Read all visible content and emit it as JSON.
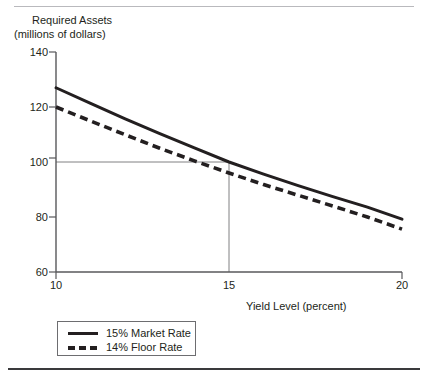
{
  "chart_data": {
    "type": "line",
    "title": "Required Assets",
    "subtitle": "(millions of dollars)",
    "ylabel": "Required Assets (millions of dollars)",
    "xlabel": "Yield Level (percent)",
    "xlim": [
      10,
      20
    ],
    "ylim": [
      60,
      140
    ],
    "xticks": [
      "10",
      "15",
      "20"
    ],
    "yticks": [
      "140",
      "120",
      "100",
      "80",
      "60"
    ],
    "grid": false,
    "legend_position": "below-left",
    "series": [
      {
        "name": "15% Market Rate",
        "style": "solid",
        "color": "#231f20",
        "x": [
          10,
          11,
          12,
          13,
          14,
          15,
          16,
          17,
          18,
          19,
          20
        ],
        "values": [
          127.0,
          121.3,
          115.7,
          110.3,
          105.1,
          100.0,
          95.6,
          91.4,
          87.4,
          83.6,
          79.2
        ]
      },
      {
        "name": "14% Floor Rate",
        "style": "dashed",
        "color": "#231f20",
        "x": [
          10,
          11,
          12,
          13,
          14,
          15,
          16,
          17,
          18,
          19,
          20
        ],
        "values": [
          120.0,
          114.9,
          109.9,
          105.0,
          100.4,
          96.0,
          91.8,
          87.9,
          84.0,
          80.0,
          75.6
        ]
      }
    ],
    "annotations": [
      {
        "name": "reference-horizontal",
        "description": "Horizontal reference line at required assets = 100",
        "y": 100,
        "x_from": 10,
        "x_to": 15,
        "color": "#808082"
      },
      {
        "name": "reference-vertical",
        "description": "Vertical reference line at yield level = 15 percent",
        "x": 15,
        "y_from": 100,
        "y_to": 60,
        "color": "#808082"
      }
    ]
  },
  "legend": {
    "items": [
      {
        "label": "15% Market Rate",
        "style": "solid"
      },
      {
        "label": "14% Floor Rate",
        "style": "dashed"
      }
    ]
  },
  "axes": {
    "y_title_line1": "Required Assets",
    "y_title_line2": "(millions of dollars)",
    "x_title": "Yield Level (percent)",
    "y_tick_140": "140",
    "y_tick_120": "120",
    "y_tick_100": "100",
    "y_tick_80": "80",
    "y_tick_60": "60",
    "x_tick_10": "10",
    "x_tick_15": "15",
    "x_tick_20": "20"
  }
}
